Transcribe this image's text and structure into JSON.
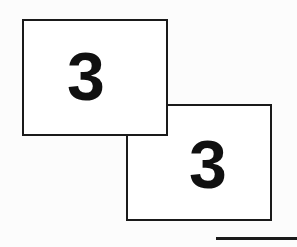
{
  "document": {
    "title": "Overlapping Numbered Cards",
    "background_color": "#fcfcfc",
    "ink_color": "#1a1a1a",
    "card_fill_color": "#ffffff"
  },
  "cards": [
    {
      "id": "card-front",
      "value": "3",
      "stacking": "front",
      "x": 22,
      "y": 19,
      "width": 146,
      "height": 117,
      "border_width": 2
    },
    {
      "id": "card-back",
      "value": "3",
      "stacking": "back",
      "x": 126,
      "y": 104,
      "width": 146,
      "height": 117,
      "border_width": 2
    }
  ],
  "rule": {
    "label": "horizontal-rule",
    "x": 216,
    "y": 237,
    "width": 81,
    "thickness": 3
  }
}
